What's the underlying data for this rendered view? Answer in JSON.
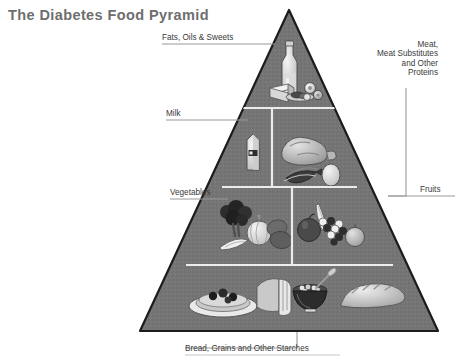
{
  "page": {
    "title": "The Diabetes Food Pyramid",
    "background_color": "#ffffff",
    "title_color": "#6e6e6e",
    "label_color": "#3a3a3a",
    "leader_line_color": "#9a9a9a"
  },
  "diagram": {
    "type": "food-pyramid",
    "shape": "triangle",
    "apex": {
      "x": 289,
      "y": 10
    },
    "base_left": {
      "x": 140,
      "y": 331
    },
    "base_right": {
      "x": 438,
      "y": 331
    },
    "fill_color": "#757575",
    "edge_color": "#1c1c1c",
    "divider_color": "#e8e8e8",
    "tiers": [
      {
        "index": 1,
        "name": "fats-oils-sweets",
        "label": "Fats, Oils & Sweets",
        "label_side": "left",
        "y_top": 10,
        "y_bottom": 108,
        "foods": [
          "oil-bottle",
          "butter-stick",
          "cookies",
          "candies"
        ]
      },
      {
        "index": 2,
        "name": "milk-and-meat",
        "y_top": 108,
        "y_bottom": 187,
        "split_x": 272,
        "sections": [
          {
            "name": "milk",
            "label": "Milk",
            "label_side": "left",
            "foods": [
              "milk-carton"
            ]
          },
          {
            "name": "meat-proteins",
            "label": "Meat,\nMeat Substitutes\nand Other\nProteins",
            "label_lines": [
              "Meat,",
              "Meat Substitutes",
              "and Other",
              "Proteins"
            ],
            "label_side": "right",
            "foods": [
              "roast-turkey",
              "fish",
              "egg"
            ]
          }
        ]
      },
      {
        "index": 3,
        "name": "vegetables-and-fruits",
        "y_top": 187,
        "y_bottom": 265,
        "split_x": 292,
        "sections": [
          {
            "name": "vegetables",
            "label": "Vegetables",
            "label_side": "left",
            "foods": [
              "broccoli",
              "onion",
              "carrot",
              "potato",
              "corn"
            ]
          },
          {
            "name": "fruits",
            "label": "Fruits",
            "label_side": "right",
            "foods": [
              "apple",
              "banana",
              "grapes",
              "orange"
            ]
          }
        ]
      },
      {
        "index": 4,
        "name": "bread-grains-starches",
        "label": "Bread, Grains and Other Starches",
        "label_side": "bottom",
        "y_top": 265,
        "y_bottom": 331,
        "foods": [
          "pancakes-with-berries",
          "sliced-bread",
          "cereal-bowl",
          "baguette"
        ]
      }
    ]
  },
  "labels": {
    "fats": "Fats, Oils & Sweets",
    "milk": "Milk",
    "vegetables": "Vegetables",
    "fruits": "Fruits",
    "bread": "Bread, Grains and Other Starches",
    "meat_line1": "Meat,",
    "meat_line2": "Meat Substitutes",
    "meat_line3": "and Other",
    "meat_line4": "Proteins"
  }
}
